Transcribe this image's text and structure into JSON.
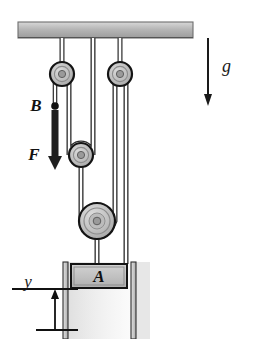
{
  "figure": {
    "type": "mechanics-diagram",
    "width": 253,
    "height": 339,
    "background": "#ffffff"
  },
  "labels": {
    "block": "A",
    "point_b": "B",
    "force": "F",
    "gravity": "g",
    "height": "y"
  },
  "colors": {
    "ceiling_fill": "#b3b3b3",
    "ceiling_edge": "#7a7a7a",
    "pulley_rim": "#1a1a1a",
    "pulley_fill": "#b8b8b8",
    "pulley_inner": "#cccccc",
    "pulley_hub": "#8f8f8f",
    "block_fill": "#c0c0c0",
    "block_edge": "#141414",
    "rail_fill": "#d6d6d6",
    "rail_edge": "#3a3a3a",
    "rope": "#2a2a2a",
    "rope_core": "#ffffff",
    "arrow": "#1a1a1a",
    "shadow": "#c9c9c9",
    "text": "#111111"
  },
  "elements": {
    "ceiling": {
      "name": "ceiling-support",
      "x": 18,
      "y": 22,
      "width": 175,
      "height": 16
    },
    "pulleys": [
      {
        "id": "upper-left",
        "cx": 62,
        "cy": 74,
        "r": 12,
        "kind": "fixed"
      },
      {
        "id": "upper-right",
        "cx": 120,
        "cy": 74,
        "r": 12,
        "kind": "fixed"
      },
      {
        "id": "middle",
        "cx": 81,
        "cy": 155,
        "r": 12,
        "kind": "movable"
      },
      {
        "id": "lower-large",
        "cx": 97,
        "cy": 221,
        "r": 18,
        "kind": "movable"
      }
    ],
    "block_a": {
      "x": 71,
      "y": 264,
      "width": 56,
      "height": 24
    },
    "rails": [
      {
        "id": "rail-left",
        "x": 63,
        "y": 262,
        "width": 5,
        "height": 76
      },
      {
        "id": "rail-right",
        "x": 131,
        "y": 262,
        "width": 5,
        "height": 76
      }
    ],
    "force_arrow": {
      "x": 49,
      "y_start": 108,
      "y_end": 166,
      "direction": "down",
      "style": "thick"
    },
    "gravity_arrow": {
      "x": 208,
      "y_start": 38,
      "y_end": 104,
      "direction": "down",
      "style": "thin"
    },
    "point_b_marker": {
      "cx": 49,
      "cy": 106,
      "r": 3.6
    },
    "dimension_y": {
      "x": 33,
      "y_top": 289,
      "y_bottom": 330,
      "tick_width": 44
    }
  },
  "icon_names": {
    "force_arrow": "down-arrow-icon",
    "gravity_arrow": "down-arrow-icon",
    "dimension_arrow": "up-arrow-icon",
    "point_marker": "point-dot-icon"
  }
}
